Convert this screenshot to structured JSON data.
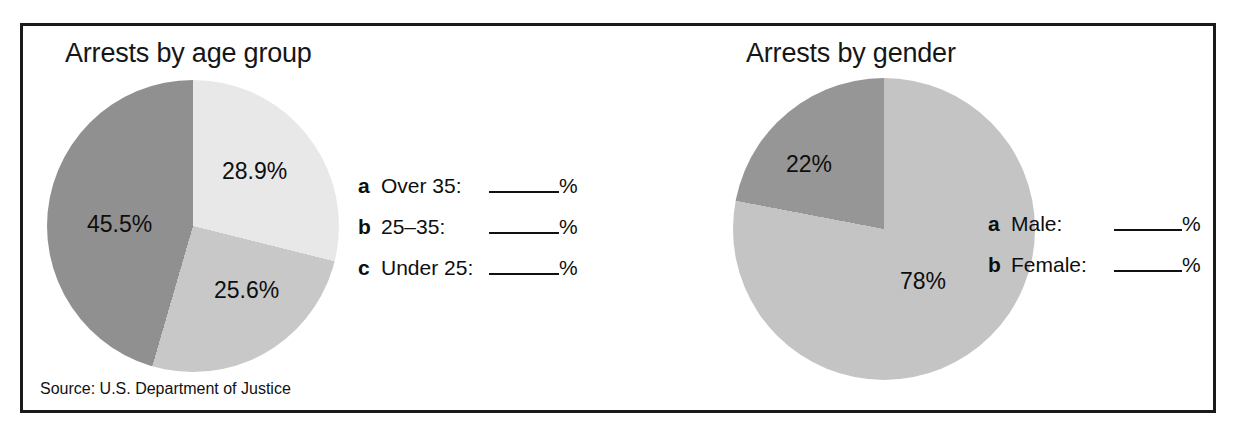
{
  "figure": {
    "source_note": "Source: U.S. Department of Justice",
    "border_color": "#1a1a1a",
    "background": "#ffffff"
  },
  "chart_data": [
    {
      "type": "pie",
      "title": "Arrests by age group",
      "categories": [
        "28.9%",
        "25.6%",
        "45.5%"
      ],
      "values": [
        28.9,
        25.6,
        45.5
      ],
      "labels": [
        "28.9%",
        "25.6%",
        "45.5%"
      ],
      "colors": [
        "#e8e8e8",
        "#c8c8c8",
        "#909090"
      ],
      "start_angle": 0,
      "direction": "clockwise",
      "legend_position": "right",
      "legend": [
        {
          "key": "a",
          "name": "Over 35:",
          "blank": "______",
          "unit": "%"
        },
        {
          "key": "b",
          "name": "25–35:",
          "blank": "______",
          "unit": "%"
        },
        {
          "key": "c",
          "name": "Under 25:",
          "blank": "______",
          "unit": "%"
        }
      ]
    },
    {
      "type": "pie",
      "title": "Arrests by gender",
      "categories": [
        "78%",
        "22%"
      ],
      "values": [
        78,
        22
      ],
      "labels": [
        "78%",
        "22%"
      ],
      "colors": [
        "#c4c4c4",
        "#969696"
      ],
      "start_angle": 0,
      "direction": "clockwise",
      "legend_position": "right",
      "legend": [
        {
          "key": "a",
          "name": "Male:",
          "blank": "______",
          "unit": "%"
        },
        {
          "key": "b",
          "name": "Female:",
          "blank": "______",
          "unit": "%"
        }
      ]
    }
  ]
}
